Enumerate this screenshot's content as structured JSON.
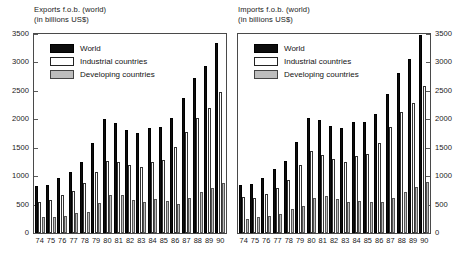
{
  "chart_data": [
    {
      "type": "bar",
      "panel": "left",
      "title": "Exports f.o.b. (world)",
      "subtitle": "(in billions US$)",
      "xlabel": "",
      "ylabel": "",
      "ylim": [
        0,
        3500
      ],
      "yticks": [
        0,
        500,
        1000,
        1500,
        2000,
        2500,
        3000,
        3500
      ],
      "ytick_labels": [
        "0",
        "500",
        "1000",
        "1500",
        "2000",
        "2500",
        "3000",
        "3500"
      ],
      "axis_side": "left",
      "grid": false,
      "legend_position": "top-left",
      "categories": [
        "74",
        "75",
        "76",
        "77",
        "78",
        "79",
        "80",
        "81",
        "82",
        "83",
        "84",
        "85",
        "86",
        "87",
        "88",
        "89",
        "90"
      ],
      "series": [
        {
          "name": "World",
          "color": "#0d0d0d",
          "values": [
            830,
            850,
            965,
            1075,
            1250,
            1590,
            2010,
            1930,
            1810,
            1760,
            1850,
            1860,
            2020,
            2380,
            2720,
            2940,
            3350
          ]
        },
        {
          "name": "Industrial countries",
          "color": "#ffffff",
          "values": [
            550,
            575,
            660,
            745,
            880,
            1070,
            1265,
            1245,
            1195,
            1165,
            1245,
            1285,
            1510,
            1780,
            2030,
            2190,
            2480
          ]
        },
        {
          "name": "Developing countries",
          "color": "#bdbdbd",
          "values": [
            275,
            275,
            305,
            345,
            375,
            530,
            665,
            665,
            580,
            540,
            600,
            565,
            515,
            620,
            720,
            795,
            880
          ]
        }
      ]
    },
    {
      "type": "bar",
      "panel": "right",
      "title": "Imports f.o.b. (world)",
      "subtitle": "(in billions US$)",
      "xlabel": "",
      "ylabel": "",
      "ylim": [
        0,
        3500
      ],
      "yticks": [
        0,
        500,
        1000,
        1500,
        2000,
        2500,
        3000,
        3500
      ],
      "ytick_labels": [
        "0",
        "500",
        "1000",
        "1500",
        "2000",
        "2500",
        "3000",
        "3500"
      ],
      "axis_side": "right",
      "grid": false,
      "legend_position": "top-left",
      "categories": [
        "74",
        "75",
        "76",
        "77",
        "78",
        "79",
        "80",
        "81",
        "82",
        "83",
        "84",
        "85",
        "86",
        "87",
        "88",
        "89",
        "90"
      ],
      "series": [
        {
          "name": "World",
          "color": "#0d0d0d",
          "values": [
            850,
            855,
            965,
            1125,
            1260,
            1600,
            2030,
            1990,
            1880,
            1840,
            1950,
            1960,
            2090,
            2450,
            2810,
            3060,
            3480
          ]
        },
        {
          "name": "Industrial countries",
          "color": "#ffffff",
          "values": [
            635,
            615,
            690,
            790,
            930,
            1190,
            1440,
            1370,
            1300,
            1255,
            1355,
            1390,
            1575,
            1860,
            2135,
            2290,
            2580
          ]
        },
        {
          "name": "Developing countries",
          "color": "#bdbdbd",
          "values": [
            255,
            290,
            305,
            330,
            425,
            470,
            615,
            645,
            605,
            545,
            555,
            545,
            540,
            610,
            730,
            805,
            900
          ]
        }
      ]
    }
  ],
  "legend": {
    "items": [
      {
        "label": "World",
        "swatch": "world"
      },
      {
        "label": "Industrial countries",
        "swatch": "ind"
      },
      {
        "label": "Developing countries",
        "swatch": "dev"
      }
    ]
  }
}
